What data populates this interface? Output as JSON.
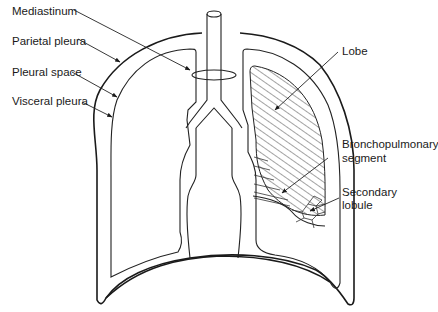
{
  "diagram": {
    "labels_left": [
      {
        "id": "mediastinum",
        "text": "Mediastinum"
      },
      {
        "id": "parietal-pleura",
        "text": "Parietal pleura"
      },
      {
        "id": "pleural-space",
        "text": "Pleural space"
      },
      {
        "id": "visceral-pleura",
        "text": "Visceral pleura"
      }
    ],
    "labels_right": [
      {
        "id": "lobe",
        "text": "Lobe"
      },
      {
        "id": "bronchopulmonary-segment",
        "line1": "Bronchopulmonary",
        "line2": "segment"
      },
      {
        "id": "secondary-lobule",
        "line1": "Secondary",
        "line2": "lobule"
      }
    ],
    "colors": {
      "line": "#1a1a1a",
      "background": "#ffffff",
      "hatch": "#333333"
    }
  }
}
